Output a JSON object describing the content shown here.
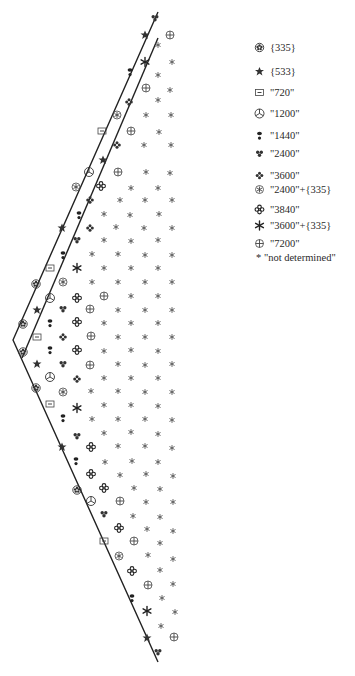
{
  "legend": {
    "items": [
      {
        "symbol": "flower",
        "label": "{335}",
        "y": 0
      },
      {
        "symbol": "star",
        "label": "{533}",
        "y": 24
      },
      {
        "symbol": "boxed-dash",
        "label": "\"720\"",
        "y": 45
      },
      {
        "symbol": "mercedes",
        "label": "\"1200\"",
        "y": 66
      },
      {
        "symbol": "keyhole",
        "label": "\"1440\"",
        "y": 88
      },
      {
        "symbol": "trefoil",
        "label": "\"2400\"",
        "y": 106
      },
      {
        "symbol": "four-dot",
        "label": "\"3600\"",
        "y": 128
      },
      {
        "symbol": "snowflake-circle",
        "label": "\"2400\"+{335}",
        "y": 142
      },
      {
        "symbol": "quad-flower",
        "label": "\"3840\"",
        "y": 162
      },
      {
        "symbol": "asterisk-bold",
        "label": "\"3600\"+{335}",
        "y": 178
      },
      {
        "symbol": "circle-cross",
        "label": "\"7200\"",
        "y": 196
      },
      {
        "symbol": "small-asterisk",
        "label": "* \"not determined\"",
        "y": 210
      }
    ]
  },
  "lines": {
    "color": "#222222",
    "outer": [
      [
        158,
        12
      ],
      [
        13,
        340
      ],
      [
        158,
        662
      ]
    ],
    "inner": [
      [
        158,
        38
      ],
      [
        22,
        358
      ]
    ]
  },
  "symbols": [
    {
      "t": "trefoil",
      "x": 155,
      "y": 18
    },
    {
      "t": "circle-cross",
      "x": 170,
      "y": 35
    },
    {
      "t": "star",
      "x": 145,
      "y": 35
    },
    {
      "t": "small-asterisk",
      "x": 158,
      "y": 45
    },
    {
      "t": "asterisk-bold",
      "x": 145,
      "y": 62
    },
    {
      "t": "small-asterisk",
      "x": 172,
      "y": 62
    },
    {
      "t": "keyhole",
      "x": 130,
      "y": 72
    },
    {
      "t": "small-asterisk",
      "x": 158,
      "y": 75
    },
    {
      "t": "circle-cross",
      "x": 146,
      "y": 88
    },
    {
      "t": "small-asterisk",
      "x": 170,
      "y": 90
    },
    {
      "t": "four-dot",
      "x": 129,
      "y": 102
    },
    {
      "t": "small-asterisk",
      "x": 158,
      "y": 100
    },
    {
      "t": "snowflake-circle",
      "x": 117,
      "y": 115
    },
    {
      "t": "small-asterisk",
      "x": 146,
      "y": 115
    },
    {
      "t": "small-asterisk",
      "x": 171,
      "y": 115
    },
    {
      "t": "boxed-dash",
      "x": 102,
      "y": 131
    },
    {
      "t": "circle-cross",
      "x": 131,
      "y": 131
    },
    {
      "t": "small-asterisk",
      "x": 159,
      "y": 132
    },
    {
      "t": "four-dot",
      "x": 117,
      "y": 145
    },
    {
      "t": "small-asterisk",
      "x": 144,
      "y": 145
    },
    {
      "t": "small-asterisk",
      "x": 171,
      "y": 145
    },
    {
      "t": "mercedes",
      "x": 89,
      "y": 172
    },
    {
      "t": "star",
      "x": 103,
      "y": 160
    },
    {
      "t": "circle-cross",
      "x": 118,
      "y": 172
    },
    {
      "t": "small-asterisk",
      "x": 146,
      "y": 172
    },
    {
      "t": "small-asterisk",
      "x": 170,
      "y": 173
    },
    {
      "t": "snowflake-circle",
      "x": 76,
      "y": 187
    },
    {
      "t": "quad-flower",
      "x": 101,
      "y": 186
    },
    {
      "t": "small-asterisk",
      "x": 131,
      "y": 188
    },
    {
      "t": "small-asterisk",
      "x": 158,
      "y": 188
    },
    {
      "t": "keyhole",
      "x": 79,
      "y": 215
    },
    {
      "t": "four-dot",
      "x": 90,
      "y": 200
    },
    {
      "t": "small-asterisk",
      "x": 120,
      "y": 200
    },
    {
      "t": "small-asterisk",
      "x": 145,
      "y": 200
    },
    {
      "t": "small-asterisk",
      "x": 172,
      "y": 200
    },
    {
      "t": "small-asterisk",
      "x": 104,
      "y": 214
    },
    {
      "t": "small-asterisk",
      "x": 130,
      "y": 215
    },
    {
      "t": "small-asterisk",
      "x": 159,
      "y": 214
    },
    {
      "t": "star",
      "x": 62,
      "y": 228
    },
    {
      "t": "four-dot",
      "x": 90,
      "y": 228
    },
    {
      "t": "small-asterisk",
      "x": 116,
      "y": 227
    },
    {
      "t": "small-asterisk",
      "x": 144,
      "y": 228
    },
    {
      "t": "small-asterisk",
      "x": 172,
      "y": 228
    },
    {
      "t": "trefoil",
      "x": 77,
      "y": 240
    },
    {
      "t": "small-asterisk",
      "x": 104,
      "y": 240
    },
    {
      "t": "small-asterisk",
      "x": 131,
      "y": 241
    },
    {
      "t": "small-asterisk",
      "x": 158,
      "y": 240
    },
    {
      "t": "keyhole",
      "x": 63,
      "y": 255
    },
    {
      "t": "small-asterisk",
      "x": 92,
      "y": 254
    },
    {
      "t": "small-asterisk",
      "x": 118,
      "y": 254
    },
    {
      "t": "small-asterisk",
      "x": 145,
      "y": 255
    },
    {
      "t": "small-asterisk",
      "x": 172,
      "y": 255
    },
    {
      "t": "boxed-dash",
      "x": 50,
      "y": 268
    },
    {
      "t": "asterisk-bold",
      "x": 77,
      "y": 268
    },
    {
      "t": "small-asterisk",
      "x": 104,
      "y": 268
    },
    {
      "t": "small-asterisk",
      "x": 131,
      "y": 268
    },
    {
      "t": "small-asterisk",
      "x": 158,
      "y": 268
    },
    {
      "t": "flower",
      "x": 36,
      "y": 284
    },
    {
      "t": "snowflake-circle",
      "x": 63,
      "y": 282
    },
    {
      "t": "small-asterisk",
      "x": 92,
      "y": 282
    },
    {
      "t": "small-asterisk",
      "x": 118,
      "y": 282
    },
    {
      "t": "small-asterisk",
      "x": 145,
      "y": 282
    },
    {
      "t": "small-asterisk",
      "x": 172,
      "y": 282
    },
    {
      "t": "star",
      "x": 37,
      "y": 310
    },
    {
      "t": "mercedes",
      "x": 50,
      "y": 298
    },
    {
      "t": "quad-flower",
      "x": 77,
      "y": 298
    },
    {
      "t": "circle-cross",
      "x": 104,
      "y": 296
    },
    {
      "t": "small-asterisk",
      "x": 131,
      "y": 296
    },
    {
      "t": "small-asterisk",
      "x": 158,
      "y": 296
    },
    {
      "t": "trefoil",
      "x": 63,
      "y": 309
    },
    {
      "t": "circle-cross",
      "x": 90,
      "y": 309
    },
    {
      "t": "small-asterisk",
      "x": 118,
      "y": 310
    },
    {
      "t": "small-asterisk",
      "x": 145,
      "y": 310
    },
    {
      "t": "small-asterisk",
      "x": 172,
      "y": 310
    },
    {
      "t": "flower",
      "x": 23,
      "y": 324
    },
    {
      "t": "keyhole",
      "x": 50,
      "y": 323
    },
    {
      "t": "quad-flower",
      "x": 77,
      "y": 322
    },
    {
      "t": "small-asterisk",
      "x": 104,
      "y": 323
    },
    {
      "t": "small-asterisk",
      "x": 131,
      "y": 323
    },
    {
      "t": "small-asterisk",
      "x": 158,
      "y": 323
    },
    {
      "t": "boxed-dash",
      "x": 37,
      "y": 337
    },
    {
      "t": "four-dot",
      "x": 63,
      "y": 337
    },
    {
      "t": "circle-cross",
      "x": 91,
      "y": 336
    },
    {
      "t": "small-asterisk",
      "x": 118,
      "y": 337
    },
    {
      "t": "small-asterisk",
      "x": 145,
      "y": 337
    },
    {
      "t": "small-asterisk",
      "x": 172,
      "y": 337
    },
    {
      "t": "flower",
      "x": 23,
      "y": 352
    },
    {
      "t": "keyhole",
      "x": 50,
      "y": 350
    },
    {
      "t": "quad-flower",
      "x": 77,
      "y": 350
    },
    {
      "t": "small-asterisk",
      "x": 104,
      "y": 351
    },
    {
      "t": "small-asterisk",
      "x": 131,
      "y": 350
    },
    {
      "t": "small-asterisk",
      "x": 158,
      "y": 351
    },
    {
      "t": "star",
      "x": 37,
      "y": 364
    },
    {
      "t": "trefoil",
      "x": 63,
      "y": 364
    },
    {
      "t": "circle-cross",
      "x": 90,
      "y": 365
    },
    {
      "t": "small-asterisk",
      "x": 118,
      "y": 364
    },
    {
      "t": "small-asterisk",
      "x": 145,
      "y": 365
    },
    {
      "t": "small-asterisk",
      "x": 172,
      "y": 364
    },
    {
      "t": "mercedes",
      "x": 50,
      "y": 377
    },
    {
      "t": "four-dot",
      "x": 77,
      "y": 379
    },
    {
      "t": "small-asterisk",
      "x": 104,
      "y": 378
    },
    {
      "t": "small-asterisk",
      "x": 131,
      "y": 378
    },
    {
      "t": "small-asterisk",
      "x": 158,
      "y": 378
    },
    {
      "t": "flower",
      "x": 36,
      "y": 388
    },
    {
      "t": "snowflake-circle",
      "x": 63,
      "y": 392
    },
    {
      "t": "small-asterisk",
      "x": 91,
      "y": 391
    },
    {
      "t": "small-asterisk",
      "x": 118,
      "y": 391
    },
    {
      "t": "small-asterisk",
      "x": 145,
      "y": 392
    },
    {
      "t": "small-asterisk",
      "x": 172,
      "y": 392
    },
    {
      "t": "boxed-dash",
      "x": 50,
      "y": 404
    },
    {
      "t": "asterisk-bold",
      "x": 77,
      "y": 408
    },
    {
      "t": "small-asterisk",
      "x": 104,
      "y": 405
    },
    {
      "t": "small-asterisk",
      "x": 131,
      "y": 405
    },
    {
      "t": "small-asterisk",
      "x": 158,
      "y": 406
    },
    {
      "t": "keyhole",
      "x": 63,
      "y": 418
    },
    {
      "t": "small-asterisk",
      "x": 92,
      "y": 419
    },
    {
      "t": "small-asterisk",
      "x": 118,
      "y": 419
    },
    {
      "t": "small-asterisk",
      "x": 145,
      "y": 419
    },
    {
      "t": "small-asterisk",
      "x": 172,
      "y": 420
    },
    {
      "t": "trefoil",
      "x": 77,
      "y": 436
    },
    {
      "t": "star",
      "x": 62,
      "y": 447
    },
    {
      "t": "quad-flower",
      "x": 91,
      "y": 447
    },
    {
      "t": "small-asterisk",
      "x": 104,
      "y": 433
    },
    {
      "t": "small-asterisk",
      "x": 131,
      "y": 432
    },
    {
      "t": "small-asterisk",
      "x": 158,
      "y": 434
    },
    {
      "t": "small-asterisk",
      "x": 118,
      "y": 446
    },
    {
      "t": "small-asterisk",
      "x": 145,
      "y": 446
    },
    {
      "t": "small-asterisk",
      "x": 172,
      "y": 448
    },
    {
      "t": "keyhole",
      "x": 76,
      "y": 461
    },
    {
      "t": "small-asterisk",
      "x": 105,
      "y": 462
    },
    {
      "t": "small-asterisk",
      "x": 132,
      "y": 461
    },
    {
      "t": "small-asterisk",
      "x": 158,
      "y": 462
    },
    {
      "t": "quad-flower",
      "x": 91,
      "y": 474
    },
    {
      "t": "small-asterisk",
      "x": 120,
      "y": 475
    },
    {
      "t": "small-asterisk",
      "x": 146,
      "y": 474
    },
    {
      "t": "small-asterisk",
      "x": 173,
      "y": 476
    },
    {
      "t": "flower",
      "x": 77,
      "y": 490
    },
    {
      "t": "quad-flower",
      "x": 104,
      "y": 488
    },
    {
      "t": "small-asterisk",
      "x": 134,
      "y": 488
    },
    {
      "t": "small-asterisk",
      "x": 160,
      "y": 489
    },
    {
      "t": "mercedes",
      "x": 91,
      "y": 501
    },
    {
      "t": "circle-cross",
      "x": 120,
      "y": 501
    },
    {
      "t": "small-asterisk",
      "x": 146,
      "y": 502
    },
    {
      "t": "small-asterisk",
      "x": 173,
      "y": 502
    },
    {
      "t": "trefoil",
      "x": 104,
      "y": 514
    },
    {
      "t": "small-asterisk",
      "x": 133,
      "y": 516
    },
    {
      "t": "small-asterisk",
      "x": 160,
      "y": 517
    },
    {
      "t": "quad-flower",
      "x": 119,
      "y": 528
    },
    {
      "t": "small-asterisk",
      "x": 147,
      "y": 529
    },
    {
      "t": "small-asterisk",
      "x": 173,
      "y": 531
    },
    {
      "t": "boxed-dash",
      "x": 104,
      "y": 541
    },
    {
      "t": "circle-cross",
      "x": 134,
      "y": 541
    },
    {
      "t": "small-asterisk",
      "x": 160,
      "y": 543
    },
    {
      "t": "snowflake-circle",
      "x": 119,
      "y": 556
    },
    {
      "t": "small-asterisk",
      "x": 148,
      "y": 555
    },
    {
      "t": "small-asterisk",
      "x": 173,
      "y": 559
    },
    {
      "t": "quad-flower",
      "x": 132,
      "y": 571
    },
    {
      "t": "small-asterisk",
      "x": 160,
      "y": 570
    },
    {
      "t": "circle-cross",
      "x": 148,
      "y": 585
    },
    {
      "t": "small-asterisk",
      "x": 173,
      "y": 584
    },
    {
      "t": "keyhole",
      "x": 132,
      "y": 598
    },
    {
      "t": "small-asterisk",
      "x": 162,
      "y": 598
    },
    {
      "t": "asterisk-bold",
      "x": 147,
      "y": 611
    },
    {
      "t": "small-asterisk",
      "x": 175,
      "y": 612
    },
    {
      "t": "small-asterisk",
      "x": 161,
      "y": 626
    },
    {
      "t": "star",
      "x": 147,
      "y": 638
    },
    {
      "t": "circle-cross",
      "x": 174,
      "y": 637
    },
    {
      "t": "trefoil",
      "x": 158,
      "y": 652
    }
  ]
}
